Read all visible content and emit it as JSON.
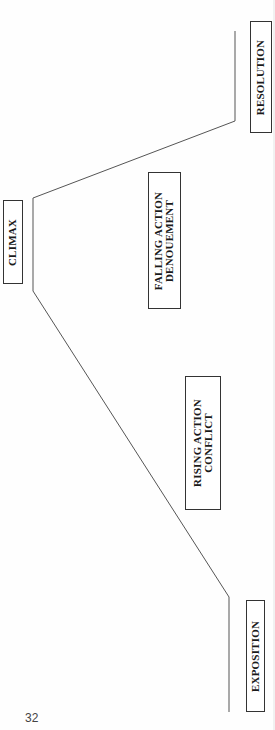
{
  "diagram": {
    "orientation": "rotated 90° counter-clockwise",
    "stages": [
      {
        "id": "exposition",
        "lines": [
          "EXPOSITION"
        ]
      },
      {
        "id": "rising-action",
        "lines": [
          "RISING ACTION",
          "CONFLICT"
        ]
      },
      {
        "id": "climax",
        "lines": [
          "CLIMAX"
        ]
      },
      {
        "id": "falling-action",
        "lines": [
          "FALLING ACTION",
          "DENOUEMENT"
        ]
      },
      {
        "id": "resolution",
        "lines": [
          "RESOLUTION"
        ]
      }
    ],
    "line_color": "#555555"
  },
  "page": {
    "number": "32"
  }
}
